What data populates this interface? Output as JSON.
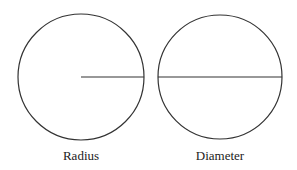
{
  "diagram": {
    "figures": [
      {
        "label": "Radius",
        "circle": {
          "cx": 81,
          "cy": 77,
          "r": 63
        },
        "line": {
          "x1": 81,
          "y1": 77,
          "x2": 144,
          "y2": 77
        }
      },
      {
        "label": "Diameter",
        "circle": {
          "cx": 220,
          "cy": 77,
          "r": 62
        },
        "line": {
          "x1": 158,
          "y1": 77,
          "x2": 282,
          "y2": 77
        }
      }
    ],
    "stroke_color": "#333333"
  }
}
